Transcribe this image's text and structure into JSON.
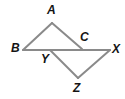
{
  "figure": {
    "type": "geometry-diagram",
    "canvas": {
      "width": 125,
      "height": 99
    },
    "style": {
      "stroke_color": "#8a8a8a",
      "stroke_width": 2,
      "background_color": "#ffffff",
      "label_color": "#141414",
      "label_font_size": 12
    },
    "points": [
      {
        "id": "A",
        "label": "A",
        "x": 52,
        "y": 23,
        "label_x": 47,
        "label_y": 4
      },
      {
        "id": "B",
        "label": "B",
        "x": 23,
        "y": 50,
        "label_x": 11,
        "label_y": 42
      },
      {
        "id": "C",
        "label": "C",
        "x": 82,
        "y": 49,
        "label_x": 80,
        "label_y": 31
      },
      {
        "id": "X",
        "label": "X",
        "x": 110,
        "y": 50,
        "label_x": 112,
        "label_y": 43
      },
      {
        "id": "Y",
        "label": "Y",
        "x": 50,
        "y": 50,
        "label_x": 41,
        "label_y": 53
      },
      {
        "id": "Z",
        "label": "Z",
        "x": 78,
        "y": 78,
        "label_x": 73,
        "label_y": 82
      }
    ],
    "segments": [
      {
        "id": "BX",
        "from": "B",
        "to": "X",
        "name": "baseline-b-x"
      },
      {
        "id": "BA",
        "from": "B",
        "to": "A",
        "name": "segment-b-a"
      },
      {
        "id": "AC",
        "from": "A",
        "to": "C",
        "name": "segment-a-c"
      },
      {
        "id": "YZ",
        "from": "Y",
        "to": "Z",
        "name": "segment-y-z"
      },
      {
        "id": "ZX",
        "from": "Z",
        "to": "X",
        "name": "segment-z-x"
      }
    ],
    "labels": {
      "A": "A",
      "B": "B",
      "C": "C",
      "X": "X",
      "Y": "Y",
      "Z": "Z"
    }
  }
}
